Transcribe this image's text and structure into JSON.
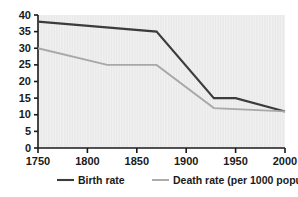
{
  "chart_data": {
    "type": "line",
    "title": "",
    "subtitle": "",
    "xlabel": "",
    "ylabel": "",
    "xlim": [
      1750,
      2000
    ],
    "ylim": [
      0,
      40
    ],
    "xticks": [
      1750,
      1800,
      1850,
      1900,
      1950,
      2000
    ],
    "yticks": [
      0,
      5,
      10,
      15,
      20,
      25,
      30,
      35,
      40
    ],
    "grid": false,
    "legend_position": "bottom",
    "series": [
      {
        "name": "Birth rate",
        "color": "#3c3c3c",
        "x": [
          1750,
          1870,
          1928,
          1950,
          2000
        ],
        "values": [
          38,
          35,
          15,
          15,
          11
        ]
      },
      {
        "name": "Death rate (per 1000 population)",
        "color": "#a8a8a8",
        "x": [
          1750,
          1820,
          1870,
          1928,
          2000
        ],
        "values": [
          30,
          25,
          25,
          12,
          11
        ]
      }
    ]
  },
  "legend": {
    "items": [
      {
        "label": "Birth rate",
        "color": "#3c3c3c"
      },
      {
        "label": "Death rate (per 1000 population)",
        "color": "#a8a8a8"
      }
    ]
  },
  "axes": {
    "x_tick_labels": [
      "1750",
      "1800",
      "1850",
      "1900",
      "1950",
      "2000"
    ],
    "y_tick_labels": [
      "0",
      "5",
      "10",
      "15",
      "20",
      "25",
      "30",
      "35",
      "40"
    ]
  },
  "colors": {
    "plot_background": "#e9e9e9",
    "axis": "#1a1a1a",
    "birth_rate": "#3c3c3c",
    "death_rate": "#a8a8a8",
    "text": "#1a1a1a",
    "page_background": "#ffffff"
  }
}
